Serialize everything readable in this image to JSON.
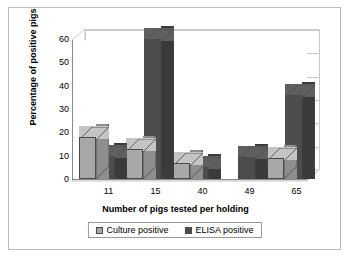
{
  "chart_data": {
    "type": "bar",
    "title": "",
    "xlabel": "Number of pigs tested per holding",
    "ylabel": "Percentage of positive pigs",
    "categories": [
      "11",
      "15",
      "40",
      "49",
      "65"
    ],
    "series": [
      {
        "name": "Culture positive",
        "color": "#a8a8a8",
        "values": [
          18,
          13,
          7,
          0,
          9
        ]
      },
      {
        "name": "ELISA positive",
        "color": "#4d4d4d",
        "values": [
          10,
          60,
          5,
          9.5,
          36
        ]
      }
    ],
    "ylim": [
      0,
      60
    ],
    "ytick_values": [
      0,
      10,
      20,
      30,
      40,
      50,
      60
    ],
    "ytick_labels": [
      "0",
      "10",
      "20",
      "30",
      "40",
      "50",
      "60"
    ],
    "grid": true,
    "grid_axis": "y",
    "legend_position": "bottom",
    "style": "3d-column"
  },
  "legend": {
    "items": [
      {
        "label": "Culture positive"
      },
      {
        "label": "ELISA positive"
      }
    ]
  }
}
